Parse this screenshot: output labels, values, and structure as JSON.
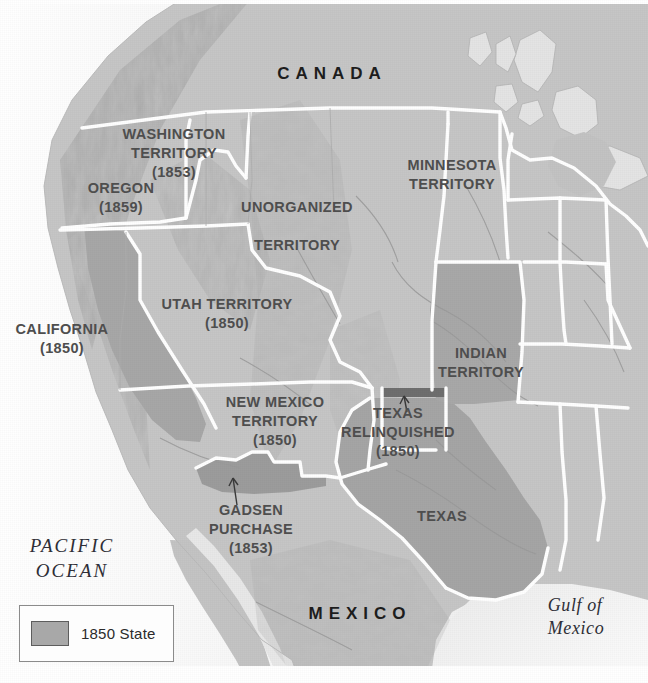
{
  "map": {
    "title": "Western United States and Territories, 1850s",
    "colors": {
      "land_light": "#c9c9c9",
      "land_mid": "#bdbdbd",
      "state_1850": "#a5a5a5",
      "ocean": "#f0f0f0",
      "border_white": "#ffffff",
      "label_text": "#4e4e4e",
      "country_text": "#1d1d1d",
      "panhandle_strip": "#6f6f6f"
    },
    "countries": [
      {
        "name": "canada",
        "label": "CANADA",
        "x": 332,
        "y": 74
      },
      {
        "name": "mexico",
        "label": "MEXICO",
        "x": 360,
        "y": 614
      }
    ],
    "waters": [
      {
        "name": "pacific-ocean",
        "label": "PACIFIC\nOCEAN",
        "x": 72,
        "y": 559
      },
      {
        "name": "gulf-of-mexico",
        "label": "Gulf of\nMexico",
        "x": 576,
        "y": 617
      }
    ],
    "territories": [
      {
        "name": "washington-territory",
        "label": "WASHINGTON\nTERRITORY\n(1853)",
        "x": 174,
        "y": 153
      },
      {
        "name": "oregon",
        "label": "OREGON\n(1859)",
        "x": 121,
        "y": 198
      },
      {
        "name": "unorganized-territory",
        "label": "UNORGANIZED\n\nTERRITORY",
        "x": 297,
        "y": 226
      },
      {
        "name": "minnesota-territory",
        "label": "MINNESOTA\nTERRITORY",
        "x": 452,
        "y": 175
      },
      {
        "name": "utah-territory",
        "label": "UTAH TERRITORY\n(1850)",
        "x": 227,
        "y": 314
      },
      {
        "name": "california",
        "label": "CALIFORNIA\n(1850)",
        "x": 62,
        "y": 339
      },
      {
        "name": "new-mexico-territory",
        "label": "NEW MEXICO\nTERRITORY\n(1850)",
        "x": 275,
        "y": 421
      },
      {
        "name": "indian-territory",
        "label": "INDIAN\nTERRITORY",
        "x": 481,
        "y": 363
      },
      {
        "name": "texas-relinquished",
        "label": "TEXAS\nRELINQUISHED\n(1850)",
        "x": 398,
        "y": 432
      },
      {
        "name": "texas",
        "label": "TEXAS",
        "x": 442,
        "y": 516
      },
      {
        "name": "gadsen-purchase",
        "label": "GADSEN\nPURCHASE\n(1853)",
        "x": 251,
        "y": 529
      }
    ],
    "legend": {
      "swatch_color": "#a8a8a8",
      "label": "1850 State"
    }
  }
}
